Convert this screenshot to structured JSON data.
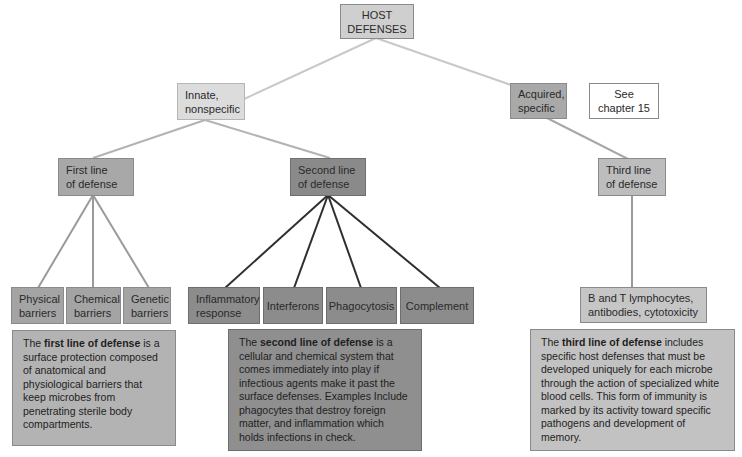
{
  "diagram": {
    "title": "HOST DEFENSES",
    "root": {
      "label": "HOST\nDEFENSES"
    },
    "branches": {
      "innate": {
        "label": "Innate,\nnonspecific"
      },
      "acquired": {
        "label": "Acquired,\nspecific"
      },
      "see_note": {
        "label": "See\nchapter 15"
      }
    },
    "lines_of_defense": {
      "first": {
        "label": "First line\nof defense",
        "children": [
          "Physical\nbarriers",
          "Chemical\nbarriers",
          "Genetic\nbarriers"
        ],
        "description": {
          "prefix": "The ",
          "bold": "first line of defense",
          "suffix": " is a surface protection composed of anatomical and physiological barriers that keep microbes from penetrating sterile body compartments."
        }
      },
      "second": {
        "label": "Second line\nof defense",
        "children": [
          "Inflammatory\nresponse",
          "Interferons",
          "Phagocytosis",
          "Complement"
        ],
        "description": {
          "prefix": "The ",
          "bold": "second line of defense",
          "suffix": " is a cellular and chemical system that comes immediately into play if infectious agents make it past the surface defenses. Examples Include phagocytes that destroy foreign matter, and inflammation which holds infections in check."
        }
      },
      "third": {
        "label": "Third line\nof defense",
        "children": [
          "B and T lymphocytes,\nantibodies, cytotoxicity"
        ],
        "description": {
          "prefix": "The ",
          "bold": "third line of defense",
          "suffix": " includes specific host defenses that must be developed uniquely for each microbe through the action of specialized white blood cells. This form of immunity is marked by its activity toward specific pathogens and development of memory."
        }
      }
    },
    "colors": {
      "connector_light": "#c4c4c4",
      "connector_mid": "#9a9a9a",
      "connector_dark": "#2f2f2f"
    }
  }
}
